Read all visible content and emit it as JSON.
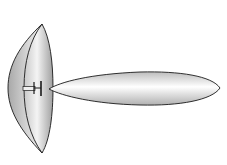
{
  "diagram": {
    "elements": [
      {
        "id": "dish",
        "label": "parabolic reflector dish"
      },
      {
        "id": "feed",
        "label": "feed horn / dipole"
      },
      {
        "id": "lobe",
        "label": "main radiation lobe"
      }
    ],
    "colors": {
      "outline": "#1a1a1a",
      "fill_light": "#f2f2f2",
      "fill_dark": "#9a9a9a",
      "background": "#ffffff"
    }
  }
}
